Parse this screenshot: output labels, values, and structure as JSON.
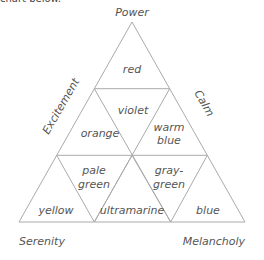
{
  "intro_text": "chart below.",
  "diagram": {
    "corners": {
      "top": "Power",
      "bottom_left": "Serenity",
      "bottom_right": "Melancholy"
    },
    "sides": {
      "left": "Excitement",
      "right": "Calm"
    },
    "cells": {
      "red": "red",
      "violet": "violet",
      "orange": "orange",
      "warm_blue_1": "warm",
      "warm_blue_2": "blue",
      "pale_green_1": "pale",
      "pale_green_2": "green",
      "gray_green_1": "gray-",
      "gray_green_2": "green",
      "yellow": "yellow",
      "ultramarine": "ultramarine",
      "blue": "blue"
    },
    "line_color": "#aaaaaa",
    "text_color": "#555555"
  }
}
